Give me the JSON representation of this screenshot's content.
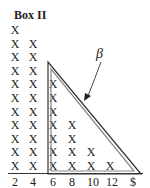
{
  "title": "Box II",
  "annotation": "β",
  "symbol": "X",
  "axis": {
    "ticks": [
      "2",
      "4",
      "6",
      "8",
      "10",
      "12",
      "$"
    ]
  },
  "chart_data": {
    "type": "dot-plot",
    "title": "Box II",
    "marker": "X",
    "categories": [
      "2",
      "4",
      "6",
      "8",
      "10",
      "12"
    ],
    "values": [
      11,
      10,
      7,
      4,
      2,
      1
    ],
    "xlabel": "$",
    "annotation": {
      "label": "β",
      "target": "triangle enclosing the distribution from 6 to 12 (and beyond to $ end)"
    }
  },
  "colors": {
    "ink": "#222222",
    "triangle_outer": "#333333",
    "triangle_inner": "#9a9a9a"
  }
}
